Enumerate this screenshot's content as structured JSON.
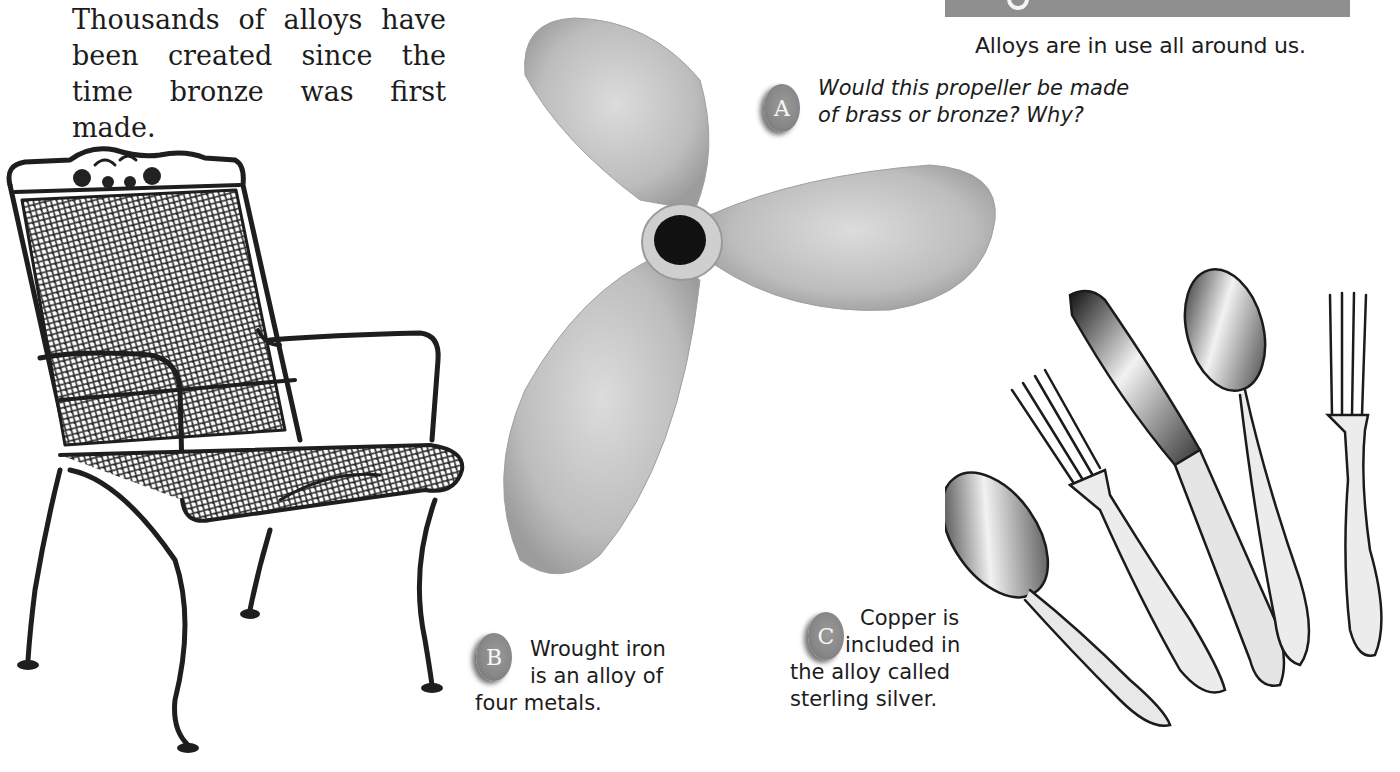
{
  "intro": {
    "text": "Thousands of alloys have been created since the time bronze was first made."
  },
  "figure": {
    "banner_color": "#8f8f8f",
    "caption": "Alloys are in use all around us."
  },
  "callouts": [
    {
      "letter": "A",
      "lines": [
        "Would this propeller be made",
        "of brass or bronze? Why?"
      ],
      "style": "italic"
    },
    {
      "letter": "B",
      "lines": [
        "Wrought iron",
        "is an alloy of",
        "four metals."
      ],
      "style": "normal"
    },
    {
      "letter": "C",
      "lines": [
        "Copper is",
        "included in",
        "the alloy called",
        "sterling silver."
      ],
      "style": "normal"
    }
  ],
  "images": {
    "chair": "wrought-iron chair",
    "propeller": "three-blade propeller",
    "silverware": "sterling silver flatware set"
  }
}
